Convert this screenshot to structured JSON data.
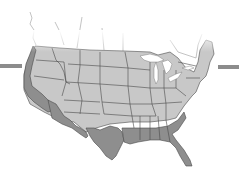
{
  "map": {
    "title": "United States coastal states map",
    "colors": {
      "interior_states": "#c8c8c8",
      "coastal_highlight_states": "#8e8e8e",
      "state_borders": "#4a4a4a",
      "side_bars": "#8c8c8c",
      "background": "#ffffff"
    },
    "highlighted_regions": [
      "Washington coast",
      "Oregon coast",
      "California",
      "Arizona south",
      "New Mexico south",
      "Texas",
      "Louisiana",
      "Mississippi",
      "Alabama",
      "Georgia",
      "South Carolina",
      "Florida"
    ]
  }
}
